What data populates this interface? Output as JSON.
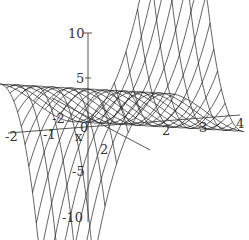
{
  "chart_data": {
    "type": "surface3d",
    "title": "",
    "axes": {
      "x": {
        "label": "x",
        "ticks": [
          -2,
          -1,
          0,
          1,
          2,
          3,
          4
        ]
      },
      "y": {
        "label": "",
        "ticks": [
          -2,
          2
        ]
      },
      "z": {
        "label": "",
        "ticks": [
          10,
          5,
          -5,
          -10
        ],
        "range": [
          -10,
          10
        ]
      }
    },
    "grid": false,
    "legend": null,
    "mesh_lines": 16,
    "stroke_color": "#222222",
    "axis_color": "#444444"
  },
  "labels": {
    "z_10": "10",
    "z_5": "5",
    "z_m5": "-5",
    "z_m10": "-10",
    "x_m2": "-2",
    "x_m1": "-1",
    "x_0": "0",
    "x_2": "2",
    "x_3": "3",
    "x_4": "4",
    "x_name": "x",
    "y_m2": "-2",
    "y_2": "2"
  }
}
